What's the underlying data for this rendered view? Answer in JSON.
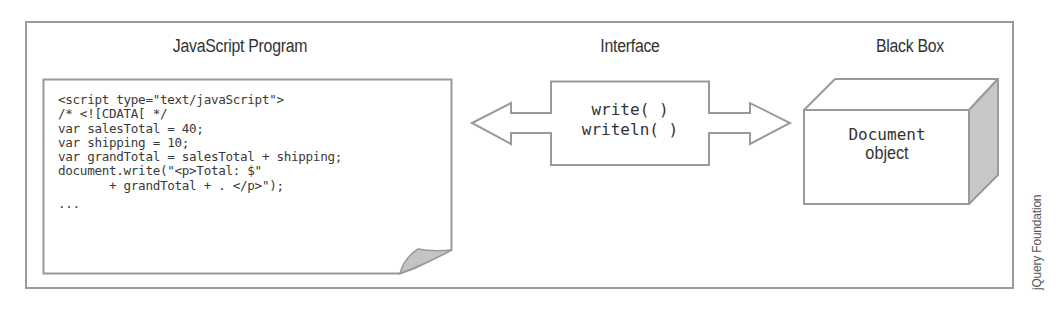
{
  "sections": {
    "program": {
      "title": "JavaScript Program",
      "code_lines": [
        "<script type=\"text/javaScript\">",
        "/* <![CDATA[ */",
        "var salesTotal = 40;",
        "var shipping = 10;",
        "var grandTotal = salesTotal + shipping;",
        "document.write(\"<p>Total: $\"",
        "       + grandTotal + . </p>\");",
        "..."
      ]
    },
    "interface": {
      "title": "Interface",
      "methods": [
        "write( )",
        "writeln( )"
      ]
    },
    "black_box": {
      "title": "Black Box",
      "object_name": "Document",
      "object_label": "object"
    }
  },
  "credit": "jQuery Foundation",
  "colors": {
    "stroke": "#9a9a9a",
    "text": "#333333",
    "shade": "#c8c8c8",
    "fold": "#c4c4c4"
  }
}
